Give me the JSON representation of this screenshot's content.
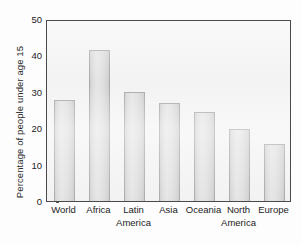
{
  "chart_data": {
    "type": "bar",
    "title": "",
    "xlabel": "",
    "ylabel": "Percentage of people under age 15",
    "ylim": [
      0,
      50
    ],
    "yticks": [
      0,
      10,
      20,
      30,
      40,
      50
    ],
    "ytick_labels": [
      "0",
      "10",
      "20",
      "30",
      "40",
      "50"
    ],
    "grid": false,
    "legend": false,
    "categories": [
      "World",
      "Africa",
      "Latin America",
      "Asia",
      "Oceania",
      "North America",
      "Europe"
    ],
    "category_lines": [
      [
        "World",
        ""
      ],
      [
        "Africa",
        ""
      ],
      [
        "Latin",
        "America"
      ],
      [
        "Asia",
        ""
      ],
      [
        "Oceania",
        ""
      ],
      [
        "North",
        "America"
      ],
      [
        "Europe",
        ""
      ]
    ],
    "values": [
      27.8,
      41.5,
      30.0,
      27.0,
      24.5,
      19.7,
      15.7
    ],
    "bar_color": "#dadada",
    "bar_edge_color": "#9a9a9a",
    "plot_background": "#f2f2f2",
    "frame_color": "#4a4a4a",
    "text_color": "#232323"
  }
}
